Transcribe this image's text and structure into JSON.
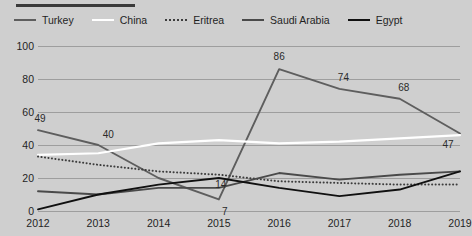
{
  "legend": {
    "items": [
      {
        "label": "Turkey",
        "color": "#5e5e5e",
        "style": "solid",
        "icon": "line-swatch-icon"
      },
      {
        "label": "China",
        "color": "#ffffff",
        "style": "solid",
        "icon": "line-swatch-icon"
      },
      {
        "label": "Eritrea",
        "color": "#3d3d3d",
        "style": "dotted",
        "icon": "dotted-line-swatch-icon"
      },
      {
        "label": "Saudi Arabia",
        "color": "#4a4a4a",
        "style": "solid",
        "icon": "line-swatch-icon"
      },
      {
        "label": "Egypt",
        "color": "#101010",
        "style": "solid",
        "icon": "line-swatch-icon"
      }
    ]
  },
  "chart_data": {
    "type": "line",
    "title": "",
    "subtitle": "",
    "xlabel": "",
    "ylabel": "",
    "categories": [
      "2012",
      "2013",
      "2014",
      "2015",
      "2016",
      "2017",
      "2018",
      "2019"
    ],
    "ylim": [
      0,
      100
    ],
    "yticks": [
      0,
      20,
      40,
      60,
      80,
      100
    ],
    "grid": true,
    "legend_position": "top-left",
    "series": [
      {
        "name": "Turkey",
        "color": "#5e5e5e",
        "style": "solid",
        "values": [
          49,
          40,
          20,
          7,
          86,
          74,
          68,
          47
        ],
        "point_labels": [
          {
            "x": "2012",
            "value": 49,
            "text": "49"
          },
          {
            "x": "2013",
            "value": 40,
            "text": "40"
          },
          {
            "x": "2015",
            "value": 7,
            "text": "7"
          },
          {
            "x": "2016",
            "value": 86,
            "text": "86"
          },
          {
            "x": "2017",
            "value": 74,
            "text": "74"
          },
          {
            "x": "2018",
            "value": 68,
            "text": "68"
          },
          {
            "x": "2019",
            "value": 47,
            "text": "47"
          }
        ]
      },
      {
        "name": "China",
        "color": "#ffffff",
        "style": "solid",
        "values": [
          34,
          35,
          41,
          43,
          41,
          42,
          44,
          46
        ],
        "point_labels": []
      },
      {
        "name": "Eritrea",
        "color": "#3d3d3d",
        "style": "dotted",
        "values": [
          33,
          28,
          24,
          22,
          18,
          17,
          16,
          16
        ],
        "point_labels": [
          {
            "x": "2015",
            "value": 22,
            "text": "14"
          }
        ]
      },
      {
        "name": "Saudi Arabia",
        "color": "#4a4a4a",
        "style": "solid",
        "values": [
          12,
          10,
          14,
          14,
          23,
          19,
          22,
          24
        ],
        "point_labels": []
      },
      {
        "name": "Egypt",
        "color": "#101010",
        "style": "solid",
        "values": [
          1,
          10,
          16,
          20,
          14,
          9,
          13,
          24
        ],
        "point_labels": []
      }
    ]
  }
}
